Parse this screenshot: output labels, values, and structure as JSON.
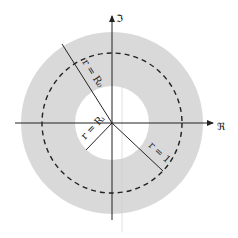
{
  "diagram": {
    "axes": {
      "real_label": "ℜ",
      "imag_label": "ℑ"
    },
    "labels": {
      "outer_radius": "r = R₀",
      "inner_radius": "r = Rᵢ",
      "unit_radius": "r = 1"
    },
    "colors": {
      "annulus_fill": "#d9d9d9",
      "inner_fill": "#ffffff",
      "lines": "#222222"
    }
  }
}
